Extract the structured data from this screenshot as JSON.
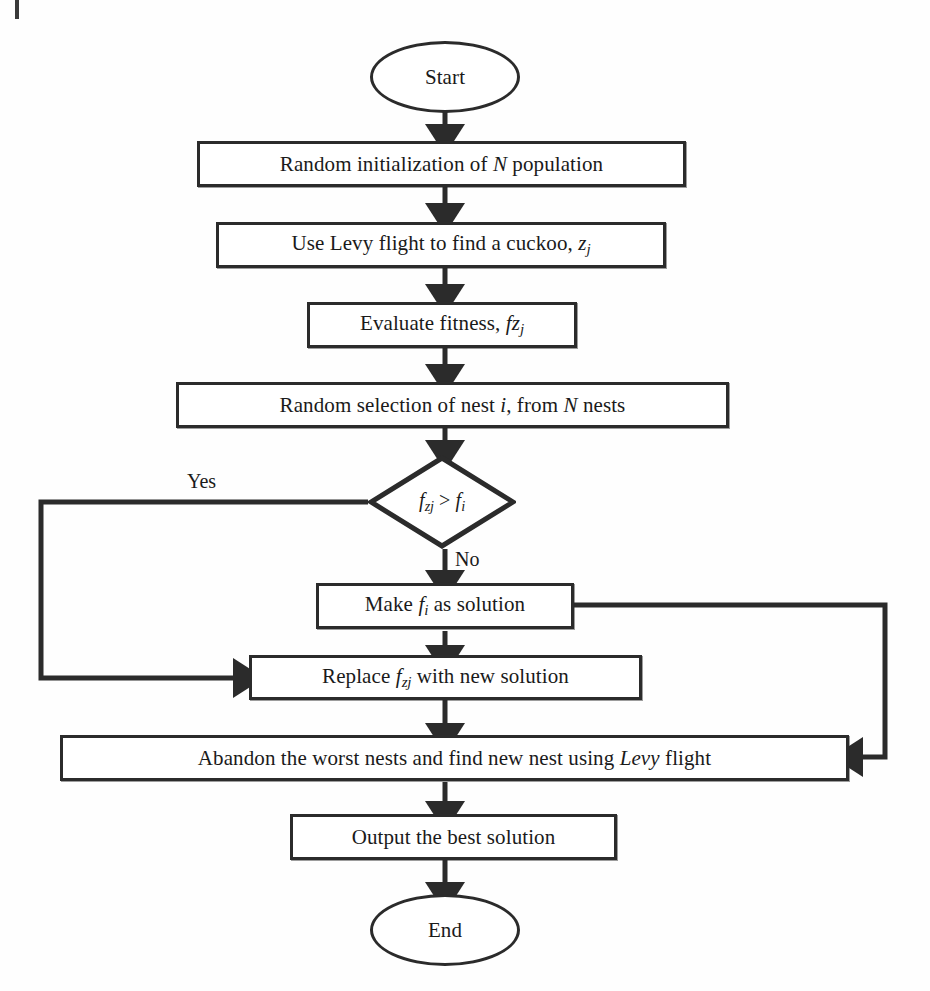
{
  "diagram": {
    "type": "flowchart",
    "stroke_color": "#2b2b2b",
    "background_color": "#fefefe",
    "nodes": [
      {
        "id": "start",
        "shape": "terminator",
        "text": "Start"
      },
      {
        "id": "init",
        "shape": "process",
        "text_plain": "Random initialization of N population"
      },
      {
        "id": "levy",
        "shape": "process",
        "text_plain": "Use Levy flight to find a cuckoo, zj"
      },
      {
        "id": "evaluate",
        "shape": "process",
        "text_plain": "Evaluate fitness, fzj"
      },
      {
        "id": "select",
        "shape": "process",
        "text_plain": "Random selection of nest i, from N nests"
      },
      {
        "id": "decision",
        "shape": "decision",
        "text_plain": "fzj > fi"
      },
      {
        "id": "make",
        "shape": "process",
        "text_plain": "Make fi as solution"
      },
      {
        "id": "replace",
        "shape": "process",
        "text_plain": "Replace fzj with new solution"
      },
      {
        "id": "abandon",
        "shape": "process",
        "text_plain": "Abandon the worst nests and find new nest using Levy flight"
      },
      {
        "id": "output",
        "shape": "process",
        "text_plain": "Output the best solution"
      },
      {
        "id": "end",
        "shape": "terminator",
        "text": "End"
      }
    ],
    "edge_labels": {
      "yes": "Yes",
      "no": "No"
    },
    "edges": [
      {
        "from": "start",
        "to": "init"
      },
      {
        "from": "init",
        "to": "levy"
      },
      {
        "from": "levy",
        "to": "evaluate"
      },
      {
        "from": "evaluate",
        "to": "select"
      },
      {
        "from": "select",
        "to": "decision"
      },
      {
        "from": "decision",
        "to": "replace",
        "label": "Yes",
        "route": "left-loop"
      },
      {
        "from": "decision",
        "to": "make",
        "label": "No",
        "route": "down"
      },
      {
        "from": "make",
        "to": "replace"
      },
      {
        "from": "make",
        "to": "abandon",
        "route": "right-loop"
      },
      {
        "from": "replace",
        "to": "abandon"
      },
      {
        "from": "abandon",
        "to": "output"
      },
      {
        "from": "output",
        "to": "end"
      }
    ]
  }
}
